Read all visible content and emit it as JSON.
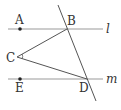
{
  "diagram": {
    "labels": {
      "A": "A",
      "B": "B",
      "C": "C",
      "D": "D",
      "E": "E",
      "line_l": "l",
      "line_m": "m"
    },
    "colors": {
      "line": "#888888",
      "stroke": "#444444",
      "text": "#333333"
    }
  }
}
